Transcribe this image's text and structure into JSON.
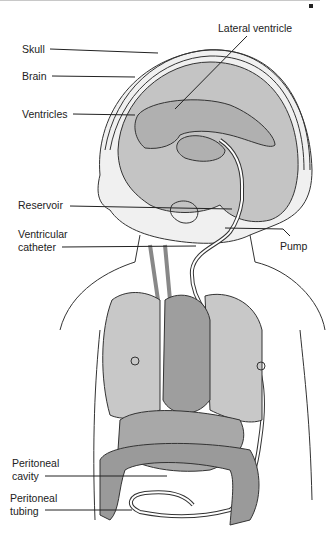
{
  "figure": {
    "colors": {
      "organ_fill": "#bdbdbd",
      "organ_dark": "#9a9a9a",
      "outline": "#222222",
      "background": "#ffffff"
    }
  },
  "labels": {
    "skull": "Skull",
    "brain": "Brain",
    "ventricles": "Ventricles",
    "lateral_ventricle": "Lateral ventricle",
    "reservoir": "Reservoir",
    "ventricular_catheter_1": "Ventricular",
    "ventricular_catheter_2": "catheter",
    "pump": "Pump",
    "peritoneal_cavity_1": "Peritoneal",
    "peritoneal_cavity_2": "cavity",
    "peritoneal_tubing_1": "Peritoneal",
    "peritoneal_tubing_2": "tubing"
  }
}
